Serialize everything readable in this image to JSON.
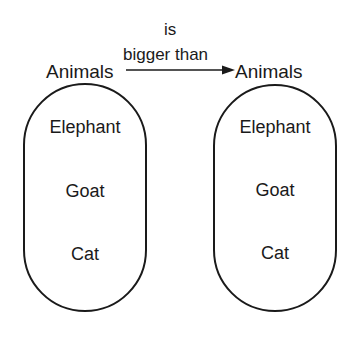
{
  "relation": {
    "line1": "is",
    "line2": "bigger than"
  },
  "domain_set": {
    "label": "Animals",
    "members": [
      "Elephant",
      "Goat",
      "Cat"
    ]
  },
  "codomain_set": {
    "label": "Animals",
    "members": [
      "Elephant",
      "Goat",
      "Cat"
    ]
  }
}
